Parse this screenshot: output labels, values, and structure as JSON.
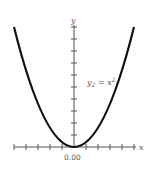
{
  "diagram": {
    "type": "function-graph",
    "x_axis_label": "x",
    "y_axis_label": "y",
    "origin_label": "0.00",
    "curve_label": {
      "base": "y",
      "subscript": "2",
      "middle": " = x",
      "superscript": "2"
    },
    "function": "y2 = x^2",
    "x_ticks_each_side": 5,
    "y_ticks": 10,
    "colors": {
      "curve": "#111111",
      "axes": "#555555",
      "background": "#ffffff"
    }
  }
}
